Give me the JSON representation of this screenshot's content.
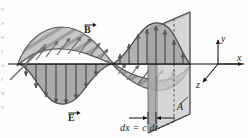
{
  "figure": {
    "kind": "physics-diagram",
    "width_px": 248,
    "height_px": 138,
    "background_color": "#fdfdfd"
  },
  "labels": {
    "b_field": "B",
    "e_field": "E",
    "axis_x": "x",
    "axis_y": "y",
    "axis_z": "z",
    "area": "A",
    "thickness": "dx = c dt"
  },
  "margin_text": {
    "lines": [
      "s",
      "e",
      "e",
      "r",
      "a",
      "t",
      "n",
      "s"
    ]
  },
  "colors": {
    "e_wave_fill": "#a9a9a9",
    "b_wave_fill": "#c2c2c2",
    "wave_outline": "#4a4a4a",
    "arrow_color": "#565656",
    "slab_face": "#b5b5b5",
    "box_face": "#cfcfcf",
    "box_edge": "#6d6d6d",
    "axis_color": "#1b1b1b",
    "hatch_color": "#8d8d8d",
    "label_color": "#1b1b1b",
    "margin_text_color": "#b9b9b9"
  },
  "geometry": {
    "axis_y_px": 64,
    "axis_x_start_px": 8,
    "axis_x_end_px": 246,
    "wave_wavelength_px": 158,
    "e_amplitude_px": 40,
    "b_amplitude_px": 34,
    "slab_left_px": 148,
    "slab_right_px": 156
  },
  "e_arrow_count": 12,
  "b_arrow_count": 13
}
